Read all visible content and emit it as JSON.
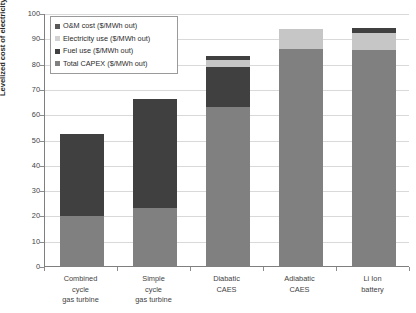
{
  "chart_data": {
    "type": "bar",
    "subtype": "stacked-column",
    "title": "",
    "xlabel": "",
    "ylabel": "Levelized cost of electricity ($/MWh)",
    "ylim": [
      0,
      100
    ],
    "ytick_step": 10,
    "yticks": [
      0,
      10,
      20,
      30,
      40,
      50,
      60,
      70,
      80,
      90,
      100
    ],
    "grid": true,
    "legend_position": "top-left-inside",
    "categories": [
      "Combined cycle gas turbine",
      "Simple cycle gas turbine",
      "Diabatic CAES",
      "Adiabatic CAES",
      "Li Ion battery"
    ],
    "category_lines": [
      [
        "Combined",
        "cycle",
        "gas turbine"
      ],
      [
        "Simple",
        "cycle",
        "gas turbine"
      ],
      [
        "Diabatic",
        "CAES",
        ""
      ],
      [
        "Adiabatic",
        "CAES",
        ""
      ],
      [
        "Li Ion",
        "battery",
        ""
      ]
    ],
    "series": [
      {
        "name": "Total CAPEX ($/MWh out)",
        "color": "#808080",
        "values": [
          19.8,
          22.8,
          63.0,
          85.8,
          85.5
        ]
      },
      {
        "name": "Fuel use ($/MWh out)",
        "color": "#404040",
        "values": [
          30.7,
          39.7,
          15.5,
          0.0,
          0.0
        ]
      },
      {
        "name": "Electricity use ($/MWh out)",
        "color": "#c6c6c6",
        "values": [
          0.0,
          0.0,
          3.0,
          7.7,
          6.7
        ]
      },
      {
        "name": "O&M cost ($/MWh out)",
        "color": "#404040",
        "values": [
          1.5,
          3.5,
          1.5,
          0.0,
          1.8
        ]
      }
    ],
    "totals": [
      52.0,
      66.0,
      83.0,
      93.5,
      94.0
    ]
  },
  "legend": {
    "entries": [
      {
        "label": "O&M cost ($/MWh out)",
        "color": "#595959"
      },
      {
        "label": "Electricity use ($/MWh out)",
        "color": "#d2d2d2"
      },
      {
        "label": "Fuel use ($/MWh out)",
        "color": "#404040"
      },
      {
        "label": "Total CAPEX ($/MWh out)",
        "color": "#808080"
      }
    ]
  },
  "axis": {
    "y_title": "Levelized cost of electricity ($/MWh)",
    "y_tick_labels": [
      "100",
      "90",
      "80",
      "70",
      "60",
      "50",
      "40",
      "30",
      "20",
      "10",
      "0"
    ]
  },
  "colors": {
    "capex": "#808080",
    "fuel": "#404040",
    "electricity": "#c6c6c6",
    "om": "#404040",
    "gridline": "#d9d9d9",
    "axis": "#7f7f7f",
    "text": "#3f3f3f"
  }
}
